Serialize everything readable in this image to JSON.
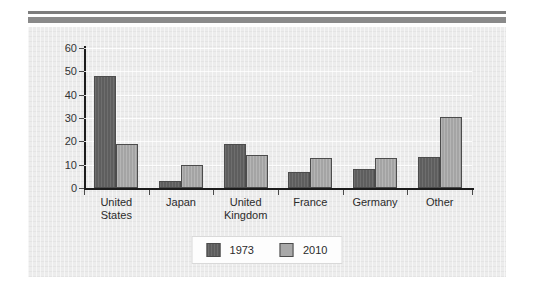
{
  "chart_data": {
    "type": "bar",
    "title": "",
    "subtitle": "",
    "xlabel": "",
    "ylabel": "",
    "ylim": [
      0,
      60
    ],
    "yticks": [
      0,
      10,
      20,
      30,
      40,
      50,
      60
    ],
    "grid": true,
    "legend_position": "bottom-center",
    "categories": [
      "United\nStates",
      "Japan",
      "United\nKingdom",
      "France",
      "Germany",
      "Other"
    ],
    "series": [
      {
        "name": "1973",
        "color": "#636363",
        "values": [
          48,
          3,
          19,
          7,
          8,
          13.5
        ]
      },
      {
        "name": "2010",
        "color": "#a9a9a9",
        "values": [
          19,
          10,
          14,
          13,
          13,
          30.5
        ]
      }
    ]
  },
  "figure": {
    "panel_background": "#ececec",
    "page_background": "#ffffff",
    "rule_thin_color": "#7d7d7d",
    "rule_thick_color": "#8a8a8a",
    "axis_color": "#1c1c1c"
  }
}
